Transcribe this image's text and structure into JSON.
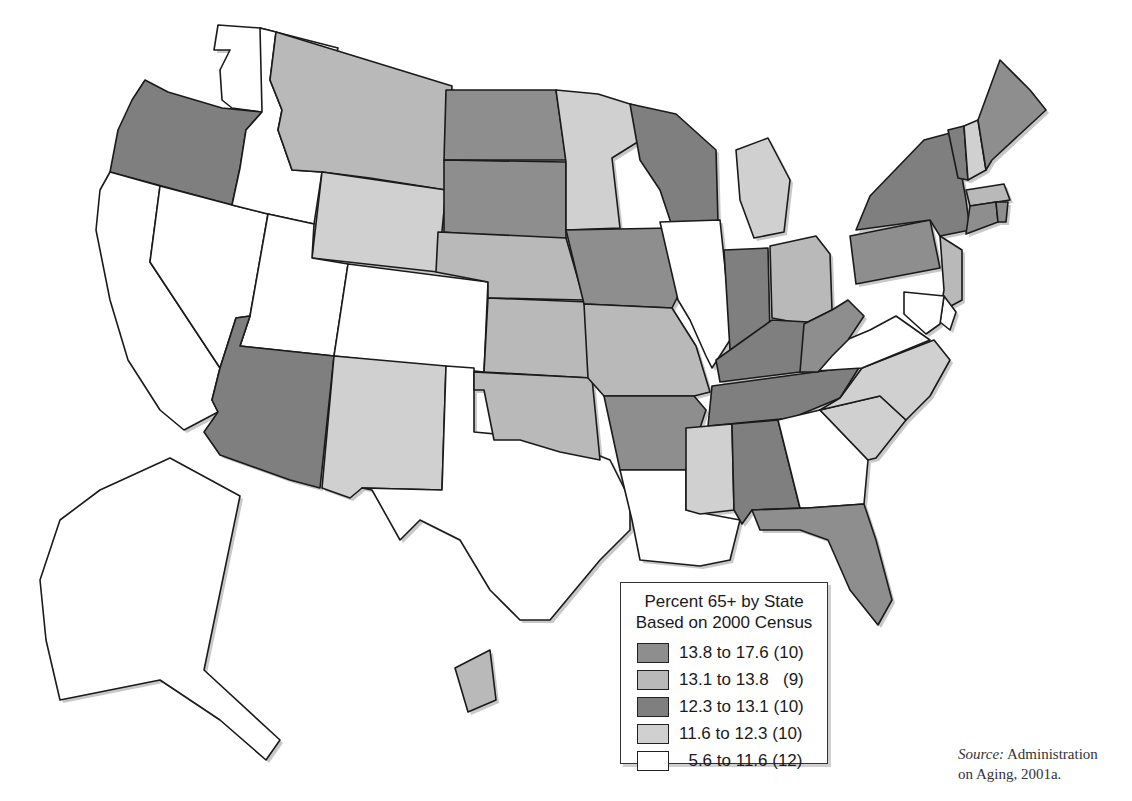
{
  "figure": {
    "type": "choropleth-map"
  },
  "legend": {
    "title_line1": "Percent 65+ by State",
    "title_line2": "Based on 2000 Census",
    "classes": [
      {
        "label": "13.8 to 17.6 (10)",
        "range": [
          13.8,
          17.6
        ],
        "count": 10,
        "color": "#8e8e8e"
      },
      {
        "label": "13.1 to 13.8   (9)",
        "range": [
          13.1,
          13.8
        ],
        "count": 9,
        "color": "#b9b9b9"
      },
      {
        "label": "12.3 to 13.1 (10)",
        "range": [
          12.3,
          13.1
        ],
        "count": 10,
        "color": "#7f7f7f"
      },
      {
        "label": "11.6 to 12.3 (10)",
        "range": [
          11.6,
          12.3
        ],
        "count": 10,
        "color": "#d0d0d0"
      },
      {
        "label": "  5.6 to 11.6 (12)",
        "range": [
          5.6,
          11.6
        ],
        "count": 12,
        "color": "#ffffff"
      }
    ]
  },
  "source": {
    "prefix": "Source:",
    "line1_rest": " Administration",
    "line2": "on Aging, 2001a."
  },
  "map_data": {
    "class_colors": {
      "c1": "#8e8e8e",
      "c2": "#b9b9b9",
      "c3": "#7f7f7f",
      "c4": "#d0d0d0",
      "c5": "#ffffff"
    },
    "states": {
      "WA": "c5",
      "OR": "c3",
      "CA": "c5",
      "NV": "c5",
      "ID": "c5",
      "MT": "c2",
      "WY": "c4",
      "UT": "c5",
      "CO": "c5",
      "AZ": "c3",
      "NM": "c4",
      "TX": "c5",
      "ND": "c1",
      "SD": "c1",
      "NE": "c2",
      "KS": "c2",
      "OK": "c2",
      "MN": "c4",
      "IA": "c1",
      "MO": "c2",
      "AR": "c1",
      "LA": "c5",
      "WI": "c3",
      "IL": "c5",
      "MI": "c4",
      "IN": "c3",
      "OH": "c2",
      "KY": "c3",
      "TN": "c3",
      "MS": "c4",
      "AL": "c3",
      "GA": "c5",
      "FL": "c1",
      "SC": "c4",
      "NC": "c4",
      "VA": "c5",
      "WV": "c1",
      "PA": "c1",
      "NY": "c3",
      "VT": "c3",
      "NH": "c4",
      "ME": "c1",
      "MA": "c2",
      "CT": "c1",
      "RI": "c1",
      "NJ": "c2",
      "DE": "c5",
      "MD": "c5",
      "AK": "c5",
      "HI": "c2"
    }
  }
}
